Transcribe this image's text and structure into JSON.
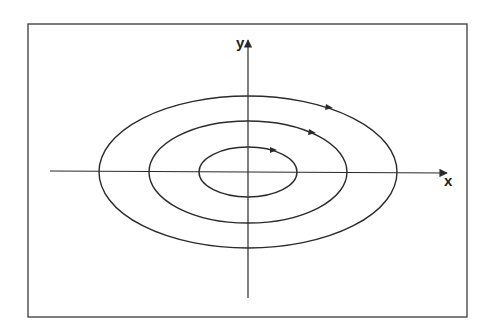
{
  "diagram": {
    "title": "",
    "axes": {
      "x_label": "x",
      "y_label": "y"
    },
    "center": [
      248,
      171
    ],
    "orbits": [
      {
        "name": "inner",
        "rx": 49,
        "ry": 25,
        "direction": "clockwise"
      },
      {
        "name": "middle",
        "rx": 99,
        "ry": 51,
        "direction": "clockwise"
      },
      {
        "name": "outer",
        "rx": 149,
        "ry": 76,
        "direction": "clockwise"
      }
    ],
    "colors": {
      "stroke": "#2b2b2b",
      "background": "#ffffff"
    }
  }
}
